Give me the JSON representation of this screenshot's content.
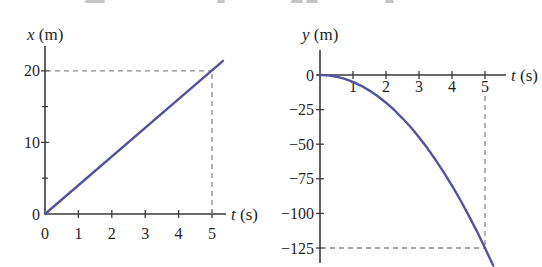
{
  "figure": {
    "background": "#ffffff",
    "curve_color": "#53549E",
    "axis_color": "#3a3a3a",
    "dash_color": "#8a8a8a",
    "text_color": "#1f1f1f"
  },
  "chart_data": [
    {
      "id": "position-x-vs-time",
      "type": "line",
      "xlabel_var": "t",
      "xlabel_unit": "(s)",
      "ylabel_var": "x",
      "ylabel_unit": "(m)",
      "x_ticks": [
        1,
        2,
        3,
        4,
        5
      ],
      "x_tick_labels": [
        0,
        1,
        2,
        3,
        4,
        5
      ],
      "y_major_ticks": [
        10,
        20
      ],
      "y_minor_ticks": [
        5,
        15
      ],
      "y_tick_labels": [
        0,
        10,
        20
      ],
      "xlim": [
        0,
        5.6
      ],
      "ylim": [
        0,
        23.5
      ],
      "series": [
        {
          "name": "x position",
          "points": [
            [
              0,
              0
            ],
            [
              5.33,
              21.4
            ]
          ]
        }
      ],
      "guide": {
        "t": 5,
        "value": 20
      }
    },
    {
      "id": "position-y-vs-time",
      "type": "line",
      "xlabel_var": "t",
      "xlabel_unit": "(s)",
      "ylabel_var": "y",
      "ylabel_unit": "(m)",
      "x_ticks": [
        1,
        2,
        3,
        4,
        5
      ],
      "x_tick_labels": [
        1,
        2,
        3,
        4,
        5
      ],
      "y_major_ticks": [
        0,
        -25,
        -50,
        -75,
        -100,
        -125
      ],
      "y_minor_ticks": [],
      "y_tick_labels": [
        0,
        -25,
        -50,
        -75,
        -100,
        -125
      ],
      "xlim": [
        0,
        5.6
      ],
      "ylim": [
        -141,
        0
      ],
      "series": [
        {
          "name": "y position",
          "points": [
            [
              0,
              0
            ],
            [
              0.25,
              -0.31
            ],
            [
              0.5,
              -1.25
            ],
            [
              0.75,
              -2.81
            ],
            [
              1,
              -5
            ],
            [
              1.25,
              -7.81
            ],
            [
              1.5,
              -11.25
            ],
            [
              1.75,
              -15.31
            ],
            [
              2,
              -20
            ],
            [
              2.25,
              -25.31
            ],
            [
              2.5,
              -31.25
            ],
            [
              2.75,
              -37.81
            ],
            [
              3,
              -45
            ],
            [
              3.25,
              -52.81
            ],
            [
              3.5,
              -61.25
            ],
            [
              3.75,
              -70.31
            ],
            [
              4,
              -80
            ],
            [
              4.25,
              -90.31
            ],
            [
              4.5,
              -101.25
            ],
            [
              4.75,
              -112.81
            ],
            [
              5,
              -125
            ],
            [
              5.25,
              -137.81
            ]
          ]
        }
      ],
      "guide": {
        "t": 5,
        "value": -125
      }
    }
  ]
}
